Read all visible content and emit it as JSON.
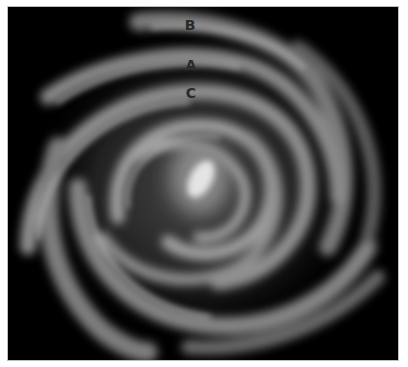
{
  "figure": {
    "background": "#000000",
    "arm_color": "#9a9a9a",
    "core_color": "#e8e8e8",
    "labels": [
      {
        "text": "B",
        "x": 190,
        "y": 25
      },
      {
        "text": "A",
        "x": 191,
        "y": 65
      },
      {
        "text": "C",
        "x": 191,
        "y": 93
      }
    ]
  }
}
